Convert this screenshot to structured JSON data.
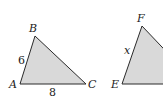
{
  "diagram": {
    "colors": {
      "fill": "#d9d9d9",
      "stroke": "#2a2a2a",
      "background": "#ffffff"
    },
    "triangles": [
      {
        "name": "ABC",
        "vertices": [
          {
            "label": "A",
            "x": 20,
            "y": 84
          },
          {
            "label": "B",
            "x": 35,
            "y": 36
          },
          {
            "label": "C",
            "x": 86,
            "y": 84
          }
        ],
        "sides": [
          {
            "between": "AB",
            "label": "6"
          },
          {
            "between": "AC",
            "label": "8"
          }
        ]
      },
      {
        "name": "EF?",
        "vertices": [
          {
            "label": "E",
            "x": 122,
            "y": 84
          },
          {
            "label": "F",
            "x": 142,
            "y": 26
          }
        ],
        "sides": [
          {
            "between": "EF",
            "label": "x"
          }
        ]
      }
    ]
  }
}
